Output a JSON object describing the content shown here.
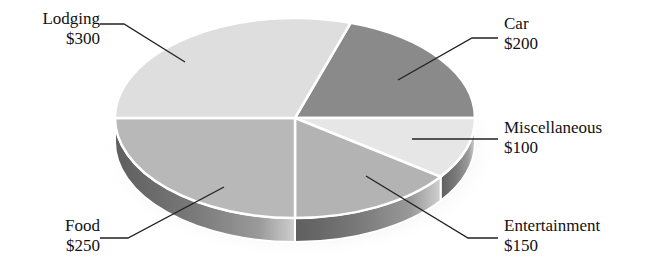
{
  "chart_data": {
    "type": "pie",
    "style": "3d-exploded-none",
    "title": "",
    "total": 1000,
    "currency": "$",
    "slices": [
      {
        "name": "Car",
        "value": 200,
        "display": "$200",
        "color": "#8a8a8a"
      },
      {
        "name": "Miscellaneous",
        "value": 100,
        "display": "$100",
        "color": "#e6e6e6"
      },
      {
        "name": "Entertainment",
        "value": 150,
        "display": "$150",
        "color": "#b3b3b3"
      },
      {
        "name": "Food",
        "value": 250,
        "display": "$250",
        "color": "#b8b8b8"
      },
      {
        "name": "Lodging",
        "value": 300,
        "display": "$300",
        "color": "#dedede"
      }
    ],
    "start_angle_deg": 18,
    "direction": "clockwise",
    "legend": "none (callout labels)"
  },
  "labels": {
    "lodging": {
      "name": "Lodging",
      "value": "$300"
    },
    "car": {
      "name": "Car",
      "value": "$200"
    },
    "misc": {
      "name": "Miscellaneous",
      "value": "$100"
    },
    "entertainment": {
      "name": "Entertainment",
      "value": "$150"
    },
    "food": {
      "name": "Food",
      "value": "$250"
    }
  }
}
